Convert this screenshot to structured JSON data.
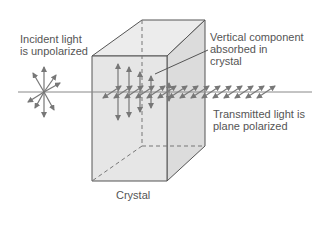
{
  "labels": {
    "incident_line1": "Incident light",
    "incident_line2": "is unpolarized",
    "vertical_line1": "Vertical component",
    "vertical_line2": "absorbed in",
    "vertical_line3": "crystal",
    "transmitted_line1": "Transmitted light is",
    "transmitted_line2": "plane polarized",
    "crystal": "Crystal"
  },
  "colors": {
    "crystal_fill": "#e6e6e6",
    "crystal_side": "#d9d9d9",
    "edge": "#555555",
    "arrow": "#777777",
    "text": "#555555"
  }
}
